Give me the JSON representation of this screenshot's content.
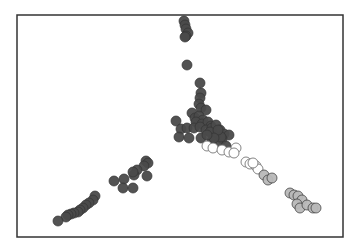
{
  "chart_data": {
    "type": "scatter",
    "title": "",
    "xlabel": "",
    "ylabel": "",
    "grid": false,
    "legend": null,
    "axes_visible": false,
    "frame": {
      "x": 17,
      "y": 15,
      "width": 326,
      "height": 222,
      "color": "#333333"
    },
    "marker_radius": 5,
    "colors": {
      "dark": "#4a4a4a",
      "light": "#b8b8b8",
      "open": "#ffffff",
      "stroke": "#333333",
      "open_stroke": "#777777"
    },
    "series": [
      {
        "name": "dark",
        "fill": "#4a4a4a",
        "points": [
          [
            184,
            21
          ],
          [
            185,
            25
          ],
          [
            186,
            29
          ],
          [
            188,
            33
          ],
          [
            186,
            36
          ],
          [
            185,
            37
          ],
          [
            187,
            65
          ],
          [
            200,
            83
          ],
          [
            201,
            93
          ],
          [
            200,
            98
          ],
          [
            199,
            104
          ],
          [
            201,
            108
          ],
          [
            206,
            110
          ],
          [
            192,
            113
          ],
          [
            195,
            118
          ],
          [
            199,
            116
          ],
          [
            203,
            120
          ],
          [
            196,
            122
          ],
          [
            202,
            124
          ],
          [
            208,
            122
          ],
          [
            211,
            126
          ],
          [
            176,
            121
          ],
          [
            181,
            129
          ],
          [
            187,
            128
          ],
          [
            194,
            128
          ],
          [
            200,
            127
          ],
          [
            206,
            130
          ],
          [
            212,
            128
          ],
          [
            216,
            125
          ],
          [
            220,
            130
          ],
          [
            224,
            134
          ],
          [
            229,
            135
          ],
          [
            222,
            139
          ],
          [
            215,
            136
          ],
          [
            210,
            132
          ],
          [
            179,
            137
          ],
          [
            189,
            138
          ],
          [
            201,
            138
          ],
          [
            212,
            141
          ],
          [
            218,
            144
          ],
          [
            226,
            146
          ],
          [
            221,
            137
          ],
          [
            218,
            130
          ],
          [
            214,
            138
          ],
          [
            207,
            135
          ],
          [
            146,
            161
          ],
          [
            148,
            163
          ],
          [
            144,
            166
          ],
          [
            137,
            170
          ],
          [
            134,
            175
          ],
          [
            133,
            172
          ],
          [
            147,
            176
          ],
          [
            124,
            179
          ],
          [
            114,
            181
          ],
          [
            123,
            188
          ],
          [
            133,
            188
          ],
          [
            95,
            196
          ],
          [
            93,
            200
          ],
          [
            89,
            203
          ],
          [
            86,
            205
          ],
          [
            83,
            208
          ],
          [
            80,
            210
          ],
          [
            78,
            212
          ],
          [
            74,
            213
          ],
          [
            71,
            214
          ],
          [
            68,
            215
          ],
          [
            66,
            217
          ],
          [
            58,
            221
          ]
        ]
      },
      {
        "name": "open",
        "fill": "#ffffff",
        "points": [
          [
            207,
            146
          ],
          [
            213,
            148
          ],
          [
            222,
            150
          ],
          [
            229,
            152
          ],
          [
            236,
            148
          ],
          [
            234,
            153
          ],
          [
            246,
            162
          ],
          [
            250,
            164
          ],
          [
            256,
            166
          ],
          [
            258,
            169
          ],
          [
            253,
            163
          ]
        ]
      },
      {
        "name": "light",
        "fill": "#b8b8b8",
        "points": [
          [
            264,
            175
          ],
          [
            268,
            180
          ],
          [
            272,
            178
          ],
          [
            290,
            193
          ],
          [
            294,
            195
          ],
          [
            298,
            196
          ],
          [
            302,
            200
          ],
          [
            297,
            204
          ],
          [
            300,
            208
          ],
          [
            307,
            205
          ],
          [
            313,
            208
          ],
          [
            316,
            208
          ]
        ]
      }
    ]
  }
}
